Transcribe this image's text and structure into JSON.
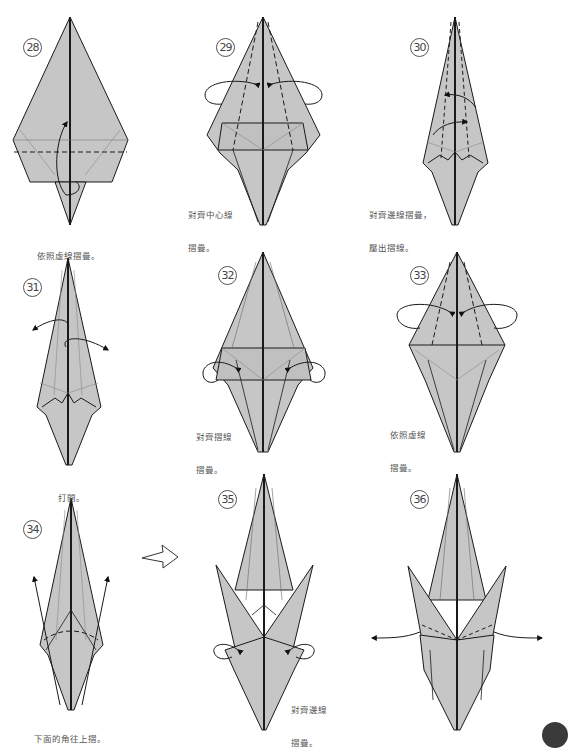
{
  "page": {
    "colors": {
      "paper_fill": "#c6c6c6",
      "line": "#1a1a1a",
      "text": "#555555",
      "background": "#ffffff"
    }
  },
  "steps": [
    {
      "number": "28",
      "caption_lines": [
        "依照虛線摺疊。"
      ]
    },
    {
      "number": "29",
      "caption_lines": [
        "對齊中心線",
        "摺疊。"
      ]
    },
    {
      "number": "30",
      "caption_lines": [
        "對齊邊線摺疊，",
        "壓出摺線。"
      ]
    },
    {
      "number": "31",
      "caption_lines": [
        "打開。"
      ]
    },
    {
      "number": "32",
      "caption_lines": [
        "對齊摺線",
        "摺疊。"
      ]
    },
    {
      "number": "33",
      "caption_lines": [
        "依照虛線",
        "摺疊。"
      ]
    },
    {
      "number": "34",
      "caption_lines": [
        "下面的角往上摺。"
      ]
    },
    {
      "number": "35",
      "caption_lines": [
        "對齊邊線",
        "摺疊。"
      ]
    },
    {
      "number": "36",
      "caption_lines": []
    }
  ],
  "transition_arrow": {
    "from_step": "34",
    "to_step": "35",
    "icon": "hollow-right-arrow-icon"
  }
}
